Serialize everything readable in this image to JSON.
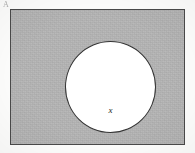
{
  "figure": {
    "type": "geometry-diagram",
    "corner_mark": "A",
    "outer_shape": {
      "name": "rectangle",
      "fill_label": "shaded",
      "fill_color": "#b9b9b9",
      "stroke_color": "#4a4a4a"
    },
    "inner_shape": {
      "name": "circle",
      "fill_label": "white",
      "fill_color": "#ffffff",
      "stroke_color": "#333333",
      "label": "x"
    },
    "background_color": "#fdfdfc"
  }
}
